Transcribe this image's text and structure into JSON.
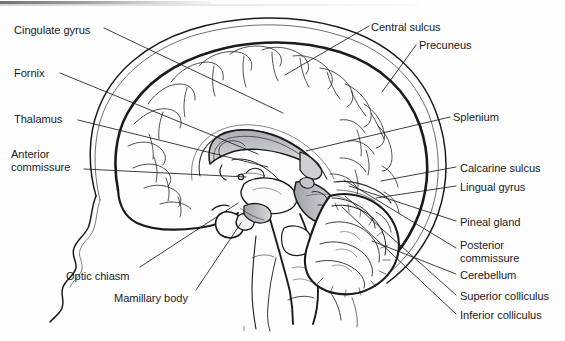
{
  "figure": {
    "type": "anatomical-diagram",
    "view": "mid-sagittal",
    "background_color": "#fefefe",
    "ink_color": "#1b1b1b",
    "shading_color": "#b9bcc2"
  },
  "labels": [
    {
      "id": "cingulate-gyrus",
      "text": "Cingulate gyrus",
      "x": 14,
      "y": 24,
      "side": "left",
      "lines": 1
    },
    {
      "id": "fornix",
      "text": "Fornix",
      "x": 14,
      "y": 67,
      "side": "left",
      "lines": 1
    },
    {
      "id": "thalamus",
      "text": "Thalamus",
      "x": 14,
      "y": 113,
      "side": "left",
      "lines": 1
    },
    {
      "id": "anterior-commissure",
      "text": "Anterior\ncommissure",
      "x": 11,
      "y": 148,
      "side": "left",
      "lines": 2
    },
    {
      "id": "optic-chiasm",
      "text": "Optic chiasm",
      "x": 66,
      "y": 270,
      "side": "left",
      "lines": 1
    },
    {
      "id": "mamillary-body",
      "text": "Mamillary body",
      "x": 114,
      "y": 292,
      "side": "left",
      "lines": 1
    },
    {
      "id": "central-sulcus",
      "text": "Central sulcus",
      "x": 371,
      "y": 21,
      "side": "right",
      "lines": 1
    },
    {
      "id": "precuneus",
      "text": "Precuneus",
      "x": 419,
      "y": 39,
      "side": "right",
      "lines": 1
    },
    {
      "id": "splenium",
      "text": "Splenium",
      "x": 453,
      "y": 111,
      "side": "right",
      "lines": 1
    },
    {
      "id": "calcarine-sulcus",
      "text": "Calcarine sulcus",
      "x": 460,
      "y": 162,
      "side": "right",
      "lines": 1
    },
    {
      "id": "lingual-gyrus",
      "text": "Lingual gyrus",
      "x": 460,
      "y": 181,
      "side": "right",
      "lines": 1
    },
    {
      "id": "pineal-gland",
      "text": "Pineal gland",
      "x": 460,
      "y": 216,
      "side": "right",
      "lines": 1
    },
    {
      "id": "posterior-commissure",
      "text": "Posterior\ncommissure",
      "x": 460,
      "y": 239,
      "side": "right",
      "lines": 2
    },
    {
      "id": "cerebellum",
      "text": "Cerebellum",
      "x": 460,
      "y": 269,
      "side": "right",
      "lines": 1
    },
    {
      "id": "superior-colliculus",
      "text": "Superior colliculus",
      "x": 460,
      "y": 290,
      "side": "right",
      "lines": 1
    },
    {
      "id": "inferior-colliculus",
      "text": "Inferior colliculus",
      "x": 460,
      "y": 309,
      "side": "right",
      "lines": 1
    }
  ],
  "leader_lines": [
    {
      "id": "leader-cingulate-gyrus",
      "from": [
        104,
        28
      ],
      "to": [
        283,
        113
      ]
    },
    {
      "id": "leader-fornix",
      "from": [
        60,
        73
      ],
      "to": [
        258,
        154
      ]
    },
    {
      "id": "leader-thalamus",
      "from": [
        78,
        120
      ],
      "to": [
        268,
        167
      ]
    },
    {
      "id": "leader-anterior-commissure",
      "from": [
        84,
        169
      ],
      "to": [
        246,
        177
      ]
    },
    {
      "id": "leader-optic-chiasm",
      "from": [
        140,
        267
      ],
      "to": [
        238,
        203
      ]
    },
    {
      "id": "leader-mamillary-body",
      "from": [
        196,
        290
      ],
      "to": [
        241,
        223
      ]
    },
    {
      "id": "leader-central-sulcus",
      "from": [
        369,
        26
      ],
      "to": [
        285,
        75
      ]
    },
    {
      "id": "leader-precuneus",
      "from": [
        416,
        45
      ],
      "to": [
        382,
        92
      ]
    },
    {
      "id": "leader-splenium",
      "from": [
        450,
        117
      ],
      "to": [
        306,
        151
      ]
    },
    {
      "id": "leader-calcarine-sulcus",
      "from": [
        456,
        167
      ],
      "to": [
        381,
        181
      ]
    },
    {
      "id": "leader-lingual-gyrus",
      "from": [
        456,
        186
      ],
      "to": [
        376,
        198
      ]
    },
    {
      "id": "leader-pineal-gland",
      "from": [
        456,
        221
      ],
      "to": [
        349,
        186
      ]
    },
    {
      "id": "leader-posterior-commissure",
      "from": [
        456,
        248
      ],
      "to": [
        344,
        180
      ]
    },
    {
      "id": "leader-cerebellum",
      "from": [
        456,
        274
      ],
      "to": [
        372,
        241
      ]
    },
    {
      "id": "leader-superior-colliculus",
      "from": [
        456,
        295
      ],
      "to": [
        345,
        196
      ]
    },
    {
      "id": "leader-inferior-colliculus",
      "from": [
        456,
        314
      ],
      "to": [
        342,
        207
      ]
    }
  ]
}
